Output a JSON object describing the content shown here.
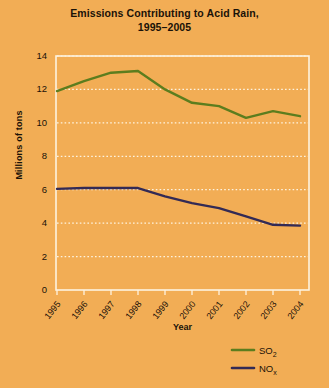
{
  "chart_data": {
    "type": "line",
    "title": "Emissions Contributing to Acid Rain,",
    "title_line2": "1995–2005",
    "xlabel": "Year",
    "ylabel": "Millions of tons",
    "categories": [
      "1995",
      "1996",
      "1997",
      "1998",
      "1999",
      "2000",
      "2001",
      "2002",
      "2003",
      "2004"
    ],
    "ylim": [
      0,
      14
    ],
    "yticks": [
      0,
      2,
      4,
      6,
      8,
      10,
      12,
      14
    ],
    "ytick_labels": [
      "0",
      "2",
      "4",
      "6",
      "8",
      "10",
      "12",
      "14"
    ],
    "grid": true,
    "grid_style": "dotted-horizontal",
    "legend_position": "bottom-right",
    "series": [
      {
        "name": "SO2",
        "label": "SO",
        "label_sub": "2",
        "color": "#5c7d1e",
        "values": [
          11.9,
          12.5,
          13.0,
          13.1,
          12.0,
          11.2,
          11.0,
          10.3,
          10.7,
          10.4
        ]
      },
      {
        "name": "NOx",
        "label": "NO",
        "label_sub": "x",
        "color": "#332a55",
        "values": [
          6.05,
          6.1,
          6.1,
          6.1,
          5.6,
          5.2,
          4.9,
          4.4,
          3.9,
          3.85
        ]
      }
    ]
  },
  "colors": {
    "background": "#f2ad55",
    "plot_border": "#fdf3e0",
    "gridline": "#fdf3e0",
    "text": "#1a1208"
  }
}
